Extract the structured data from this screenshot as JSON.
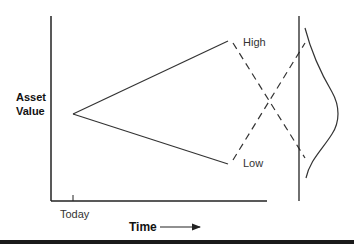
{
  "diagram": {
    "y_axis_label_line1": "Asset",
    "y_axis_label_line2": "Value",
    "x_axis_label": "Time",
    "x_tick_label": "Today",
    "branch_high_label": "High",
    "branch_low_label": "Low",
    "colors": {
      "line": "#333333",
      "axis": "#222222",
      "bottom_bar": "#1a1a1a",
      "background": "#ffffff"
    }
  }
}
